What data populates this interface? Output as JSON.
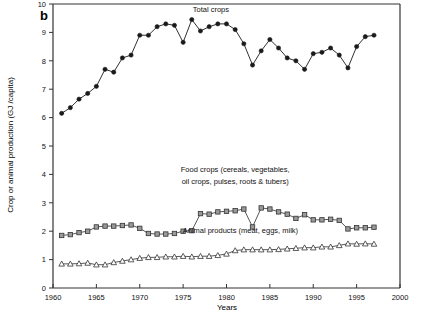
{
  "panel": {
    "label": "b"
  },
  "axes": {
    "x": {
      "title": "Years",
      "min": 1960,
      "max": 2000,
      "ticks": [
        1960,
        1965,
        1970,
        1975,
        1980,
        1985,
        1990,
        1995,
        2000
      ],
      "tick_labels": [
        "1960",
        "1965",
        "1970",
        "1975",
        "1980",
        "1985",
        "1990",
        "1995",
        "2000"
      ]
    },
    "y": {
      "title": "Crop or animal production (GJ /capita)",
      "min": 0,
      "max": 10,
      "ticks": [
        0,
        1,
        2,
        3,
        4,
        5,
        6,
        7,
        8,
        9,
        10
      ],
      "tick_labels": [
        "0",
        "1",
        "2",
        "3",
        "4",
        "5",
        "6",
        "7",
        "8",
        "9",
        "10"
      ]
    }
  },
  "annotations": [
    {
      "name": "total-crops-label",
      "text": "Total crops",
      "x": 1978.2,
      "y": 9.72
    },
    {
      "name": "food-crops-label-line1",
      "text": "Food crops (cereals, vegetables,",
      "x": 1981.0,
      "y": 4.08
    },
    {
      "name": "food-crops-label-line2",
      "text": "oil crops, pulses, roots & tubers)",
      "x": 1981.0,
      "y": 3.68
    },
    {
      "name": "animal-products-label",
      "text": "Animal products (meat, eggs, milk)",
      "x": 1981.6,
      "y": 1.95
    }
  ],
  "chart_data": {
    "type": "line",
    "title": "",
    "xlabel": "Years",
    "ylabel": "Crop or animal production (GJ /capita)",
    "xlim": [
      1960,
      2000
    ],
    "ylim": [
      0,
      10
    ],
    "grid": false,
    "legend": "annotations-inline",
    "x": [
      1961,
      1962,
      1963,
      1964,
      1965,
      1966,
      1967,
      1968,
      1969,
      1970,
      1971,
      1972,
      1973,
      1974,
      1975,
      1976,
      1977,
      1978,
      1979,
      1980,
      1981,
      1982,
      1983,
      1984,
      1985,
      1986,
      1987,
      1988,
      1989,
      1990,
      1991,
      1992,
      1993,
      1994,
      1995,
      1996,
      1997
    ],
    "series": [
      {
        "name": "Total crops",
        "marker": "filled-circle",
        "color": "#1a1a1a",
        "values": [
          6.15,
          6.35,
          6.65,
          6.85,
          7.1,
          7.7,
          7.6,
          8.1,
          8.2,
          8.9,
          8.9,
          9.2,
          9.3,
          9.25,
          8.65,
          9.45,
          9.05,
          9.2,
          9.3,
          9.3,
          9.1,
          8.6,
          7.85,
          8.35,
          8.75,
          8.45,
          8.1,
          8.0,
          7.7,
          8.25,
          8.3,
          8.45,
          8.2,
          7.75,
          8.5,
          8.85,
          8.9
        ]
      },
      {
        "name": "Food crops (cereals, vegetables, oil crops, pulses, roots & tubers)",
        "marker": "open-square",
        "color": "#444444",
        "values": [
          1.85,
          1.88,
          1.95,
          2.0,
          2.15,
          2.18,
          2.18,
          2.2,
          2.22,
          2.1,
          1.92,
          1.9,
          1.9,
          1.92,
          2.0,
          2.02,
          2.62,
          2.6,
          2.68,
          2.7,
          2.72,
          2.78,
          2.15,
          2.82,
          2.78,
          2.68,
          2.6,
          2.45,
          2.58,
          2.4,
          2.4,
          2.42,
          2.38,
          2.08,
          2.12,
          2.12,
          2.14
        ]
      },
      {
        "name": "Animal products (meat, eggs, milk)",
        "marker": "open-triangle",
        "color": "#444444",
        "values": [
          0.85,
          0.85,
          0.86,
          0.88,
          0.82,
          0.82,
          0.9,
          0.95,
          1.0,
          1.05,
          1.08,
          1.08,
          1.1,
          1.1,
          1.12,
          1.1,
          1.12,
          1.12,
          1.15,
          1.2,
          1.32,
          1.35,
          1.35,
          1.35,
          1.35,
          1.36,
          1.38,
          1.4,
          1.42,
          1.42,
          1.45,
          1.45,
          1.5,
          1.56,
          1.55,
          1.56,
          1.55
        ]
      }
    ]
  }
}
